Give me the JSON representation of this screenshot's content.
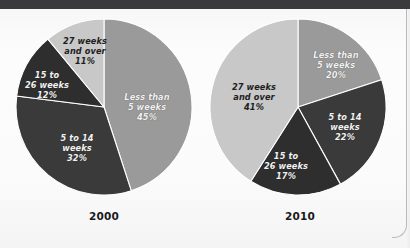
{
  "figure": {
    "background_color": "#fbfbfb",
    "top_band_color": "#3a3a3c"
  },
  "palette": {
    "less_than_5": "#9a9a9a",
    "five_to_14": "#3a3a3a",
    "fifteen_to_26": "#2e2e2e",
    "twentyseven_plus": "#c8c8c8",
    "slice_outline": "#ffffff",
    "label_on_dark": "#f2f2f2",
    "label_on_light": "#1e1e1e"
  },
  "chart_data": [
    {
      "type": "pie",
      "title": "2000",
      "xlabel": "",
      "ylabel": "",
      "legend": "none",
      "start_angle_deg": 0,
      "direction": "clockwise",
      "categories": [
        "Less than 5 weeks",
        "5 to 14 weeks",
        "15 to 26 weeks",
        "27 weeks and over"
      ],
      "values": [
        45,
        32,
        12,
        11
      ],
      "value_labels": [
        "45%",
        "32%",
        "12%",
        "11%"
      ],
      "colors": [
        "#9a9a9a",
        "#3a3a3a",
        "#2e2e2e",
        "#c8c8c8"
      ],
      "slices": [
        {
          "label_line1": "Less than",
          "label_line2": "5 weeks",
          "percent_text": "45%",
          "value": 45,
          "color": "#9a9a9a",
          "text_color": "light"
        },
        {
          "label_line1": "5 to 14",
          "label_line2": "weeks",
          "percent_text": "32%",
          "value": 32,
          "color": "#3a3a3a",
          "text_color": "light"
        },
        {
          "label_line1": "15 to",
          "label_line2": "26 weeks",
          "percent_text": "12%",
          "value": 12,
          "color": "#2e2e2e",
          "text_color": "light"
        },
        {
          "label_line1": "27 weeks",
          "label_line2": "and over",
          "percent_text": "11%",
          "value": 11,
          "color": "#c8c8c8",
          "text_color": "dark"
        }
      ]
    },
    {
      "type": "pie",
      "title": "2010",
      "xlabel": "",
      "ylabel": "",
      "legend": "none",
      "start_angle_deg": 0,
      "direction": "clockwise",
      "categories": [
        "Less than 5 weeks",
        "5 to 14 weeks",
        "15 to 26 weeks",
        "27 weeks and over"
      ],
      "values": [
        20,
        22,
        17,
        41
      ],
      "value_labels": [
        "20%",
        "22%",
        "17%",
        "41%"
      ],
      "colors": [
        "#9a9a9a",
        "#3a3a3a",
        "#2e2e2e",
        "#c8c8c8"
      ],
      "slices": [
        {
          "label_line1": "Less than",
          "label_line2": "5 weeks",
          "percent_text": "20%",
          "value": 20,
          "color": "#9a9a9a",
          "text_color": "light"
        },
        {
          "label_line1": "5 to 14",
          "label_line2": "weeks",
          "percent_text": "22%",
          "value": 22,
          "color": "#3a3a3a",
          "text_color": "light"
        },
        {
          "label_line1": "15 to",
          "label_line2": "26 weeks",
          "percent_text": "17%",
          "value": 17,
          "color": "#2e2e2e",
          "text_color": "light"
        },
        {
          "label_line1": "27 weeks",
          "label_line2": "and over",
          "percent_text": "41%",
          "value": 41,
          "color": "#c8c8c8",
          "text_color": "dark"
        }
      ]
    }
  ],
  "captions": {
    "left_year": "2000",
    "right_year": "2010"
  },
  "labels_2000": {
    "s0": "Less than\n5 weeks\n45%",
    "s1": "5 to 14\nweeks\n32%",
    "s2": "15 to\n26 weeks\n12%",
    "s3": "27 weeks\nand over\n11%"
  },
  "labels_2010": {
    "s0": "Less than\n5 weeks\n20%",
    "s1": "5 to 14\nweeks\n22%",
    "s2": "15 to\n26 weeks\n17%",
    "s3": "27 weeks\nand over\n41%"
  }
}
